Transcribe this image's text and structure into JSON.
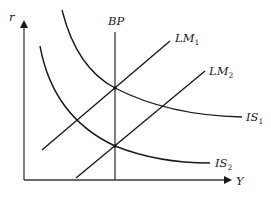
{
  "diagram": {
    "axes": {
      "y_label": "r",
      "x_label": "Y"
    },
    "curves": {
      "bp": {
        "label": "BP"
      },
      "lm1": {
        "label": "LM",
        "subscript": "1"
      },
      "lm2": {
        "label": "LM",
        "subscript": "2"
      },
      "is1": {
        "label": "IS",
        "subscript": "1"
      },
      "is2": {
        "label": "IS",
        "subscript": "2"
      }
    },
    "colors": {
      "line": "#1a1a1a",
      "axis": "#3a3a3a",
      "background": "#ffffff"
    }
  }
}
